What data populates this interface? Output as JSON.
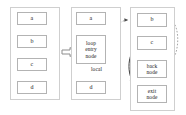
{
  "figure": {
    "panels": [
      {
        "id": "original-cfg",
        "name": "original-control-flow-graph",
        "nodes": [
          {
            "id": "a",
            "label": "a"
          },
          {
            "id": "b",
            "label": "b"
          },
          {
            "id": "c",
            "label": "c"
          },
          {
            "id": "d",
            "label": "d"
          }
        ],
        "edges": [
          {
            "from": "a",
            "to": "b",
            "style": "solid"
          },
          {
            "from": "b",
            "to": "c",
            "style": "solid"
          },
          {
            "from": "c",
            "to": "b",
            "style": "solid",
            "kind": "back-edge"
          },
          {
            "from": "c",
            "to": "d",
            "style": "solid"
          }
        ]
      },
      {
        "id": "outer-region",
        "name": "outer-region-graph",
        "nodes": [
          {
            "id": "a2",
            "label": "a"
          },
          {
            "id": "loop-entry",
            "label": "loop\nentry\nnode"
          },
          {
            "id": "d2",
            "label": "d"
          }
        ],
        "edges": [
          {
            "from": "a2",
            "to": "loop-entry",
            "style": "solid"
          },
          {
            "from": "loop-entry",
            "to": "d2",
            "style": "solid",
            "label": "local"
          }
        ],
        "labels": [
          {
            "id": "local",
            "text": "local"
          }
        ]
      },
      {
        "id": "loop-body-region",
        "name": "loop-body-region-graph",
        "nodes": [
          {
            "id": "b3",
            "label": "b"
          },
          {
            "id": "c3",
            "label": "c"
          },
          {
            "id": "back",
            "label": "back\nnode"
          },
          {
            "id": "exit",
            "label": "exit\nnode"
          }
        ],
        "edges": [
          {
            "from": "b3",
            "to": "c3",
            "style": "solid"
          },
          {
            "from": "c3",
            "to": "back",
            "style": "solid"
          },
          {
            "from": "c3",
            "to": "exit",
            "style": "solid"
          },
          {
            "from": "back",
            "to": "b3",
            "style": "dashed",
            "kind": "back-edge"
          },
          {
            "from": "loop-entry",
            "to": "b3",
            "style": "dashed",
            "kind": "cross-region"
          }
        ]
      }
    ],
    "transform_arrow": {
      "glyph": "double-right-arrow",
      "symbol": "⇒"
    },
    "colors": {
      "node_border": "#b3b3b3",
      "panel_border": "#cfcfcf",
      "edge": "#3a3a3a",
      "dashed_edge": "#8a8a8a",
      "text": "#1a1a1a",
      "background": "#ffffff"
    }
  }
}
